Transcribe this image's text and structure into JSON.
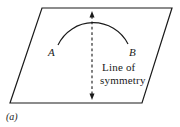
{
  "figure": {
    "caption": "(a)",
    "points": {
      "left_label": "A",
      "right_label": "B"
    },
    "symmetry_label": {
      "line1": "Line of",
      "line2": "symmetry"
    },
    "colors": {
      "line": "#1a1a1a",
      "background": "#ffffff"
    }
  }
}
